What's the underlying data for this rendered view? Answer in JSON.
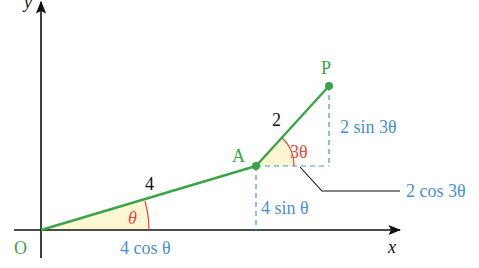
{
  "diagram": {
    "axes": {
      "x_label": "x",
      "y_label": "y"
    },
    "points": {
      "origin": "O",
      "a": "A",
      "p": "P"
    },
    "segments": {
      "oa_length": "4",
      "ap_length": "2"
    },
    "angles": {
      "theta": "θ",
      "three_theta": "3θ"
    },
    "components": {
      "oa_horizontal": "4 cos θ",
      "oa_vertical": "4 sin θ",
      "ap_horizontal": "2 cos 3θ",
      "ap_vertical": "2 sin 3θ"
    },
    "colors": {
      "segment": "#3aa548",
      "point_label": "#3aa548",
      "angle": "#e8473a",
      "component": "#4a90d0",
      "axis": "#111111",
      "angle_fill": "#fdf6d3"
    }
  }
}
